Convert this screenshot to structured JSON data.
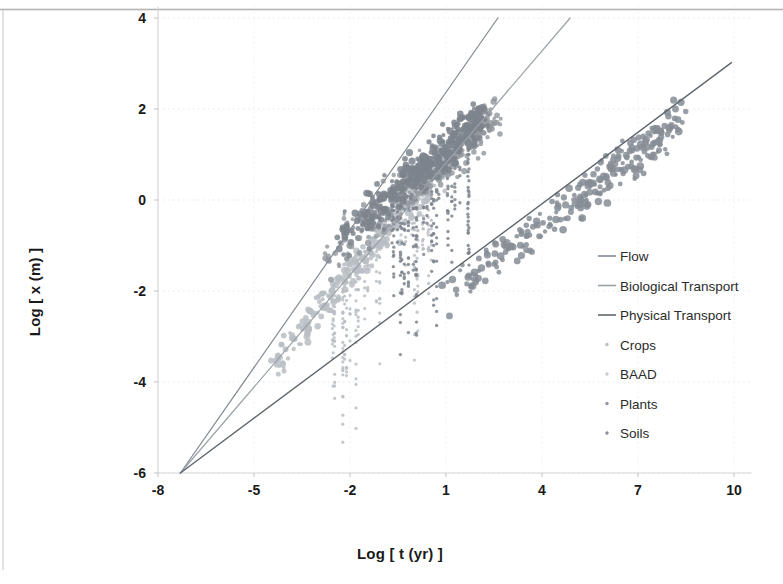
{
  "chart_data": {
    "type": "scatter",
    "title": "",
    "xlabel": "Log [ t (yr) ]",
    "ylabel": "Log [ x (m) ]",
    "xlim": [
      -8.6,
      10.6
    ],
    "ylim": [
      -6.4,
      4.25
    ],
    "xticks": [
      -8,
      -5,
      -2,
      1,
      4,
      7,
      10
    ],
    "yticks": [
      -6,
      -4,
      -2,
      0,
      2,
      4
    ],
    "grid": "light-dotted",
    "legend_position": "right-inside",
    "origin": [
      -7.3,
      -6.0
    ],
    "lines": [
      {
        "name": "Flow",
        "color": "#808891",
        "width": 1.2,
        "x0": -7.3,
        "y0": -6.0,
        "x1": 2.62,
        "y1": 4.0,
        "slope": 1.008
      },
      {
        "name": "Biological Transport",
        "color": "#9aa1a8",
        "width": 1.2,
        "x0": -7.3,
        "y0": -6.0,
        "x1": 4.88,
        "y1": 4.0,
        "slope": 0.821
      },
      {
        "name": "Physical Transport",
        "color": "#5f666d",
        "width": 1.4,
        "x0": -7.3,
        "y0": -6.0,
        "x1": 9.92,
        "y1": 3.02,
        "slope": 0.524
      }
    ],
    "series": [
      {
        "name": "Crops",
        "color": "#b9bec4",
        "marker": "dot",
        "size": 2.6,
        "opacity": 0.85,
        "n": 340,
        "cluster": {
          "xmin": -4.6,
          "xmax": 1.2,
          "trend_slope": 0.82,
          "trend_intercept": 0.0,
          "spread": 0.45
        }
      },
      {
        "name": "BAAD",
        "color": "#90969c",
        "marker": "dot",
        "size": 2.4,
        "opacity": 0.8,
        "n": 300,
        "cluster": {
          "xmin": -2.8,
          "xmax": 2.6,
          "trend_slope": 0.55,
          "trend_intercept": 0.35,
          "spread": 0.6
        }
      },
      {
        "name": "Plants",
        "color": "#7d848c",
        "marker": "dot",
        "size": 2.7,
        "opacity": 0.85,
        "n": 380,
        "cluster": {
          "xmin": -2.4,
          "xmax": 2.2,
          "trend_slope": 0.6,
          "trend_intercept": 0.55,
          "spread": 0.55
        }
      },
      {
        "name": "Soils",
        "color": "#868d95",
        "marker": "dot",
        "size": 2.9,
        "opacity": 0.85,
        "n": 260,
        "cluster": {
          "xmin": 1.0,
          "xmax": 8.4,
          "trend_slope": 0.52,
          "trend_intercept": -2.6,
          "spread": 0.55
        }
      }
    ],
    "legend_entries": [
      {
        "label": "Flow",
        "type": "line",
        "color": "#808891"
      },
      {
        "label": "Biological Transport",
        "type": "line",
        "color": "#9aa1a8"
      },
      {
        "label": "Physical Transport",
        "type": "line",
        "color": "#5f666d"
      },
      {
        "label": "Crops",
        "type": "marker",
        "color": "#b9bec4"
      },
      {
        "label": "BAAD",
        "type": "marker",
        "color": "#c8ccd1"
      },
      {
        "label": "Plants",
        "type": "marker",
        "color": "#9096a0"
      },
      {
        "label": "Soils",
        "type": "marker",
        "color": "#888f97"
      }
    ]
  },
  "axes": {
    "x_label": "Log [ t (yr) ]",
    "y_label": "Log [ x (m) ]"
  }
}
